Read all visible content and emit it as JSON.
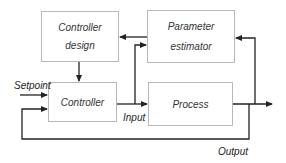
{
  "blocks": {
    "controller_design": {
      "line1": "Controller",
      "line2": "design"
    },
    "parameter_estimator": {
      "line1": "Parameter",
      "line2": "estimator"
    },
    "controller": {
      "label": "Controller"
    },
    "process": {
      "label": "Process"
    }
  },
  "signals": {
    "setpoint": "Setpoint",
    "input": "Input",
    "output": "Output"
  },
  "colors": {
    "line": "#222222",
    "box_border": "#b8b8b8"
  }
}
